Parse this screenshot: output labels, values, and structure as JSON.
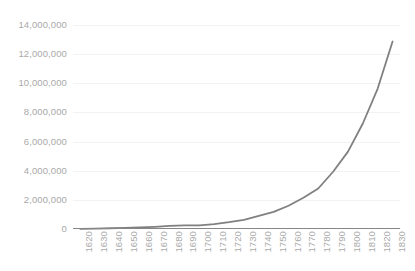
{
  "chart_data": {
    "type": "line",
    "title": "",
    "xlabel": "",
    "ylabel": "",
    "categories": [
      "1620",
      "1630",
      "1640",
      "1650",
      "1660",
      "1670",
      "1680",
      "1690",
      "1700",
      "1710",
      "1720",
      "1730",
      "1740",
      "1750",
      "1760",
      "1770",
      "1780",
      "1790",
      "1800",
      "1810",
      "1820",
      "1830"
    ],
    "values": [
      2300,
      26600,
      51000,
      75000,
      114000,
      152000,
      210000,
      250000,
      250900,
      331700,
      466200,
      629400,
      905600,
      1170800,
      1593600,
      2148100,
      2780400,
      3929214,
      5308483,
      7239881,
      9638453,
      12866020
    ],
    "series": [
      {
        "name": "Population",
        "values": [
          2300,
          26600,
          51000,
          75000,
          114000,
          152000,
          210000,
          250000,
          250900,
          331700,
          466200,
          629400,
          905600,
          1170800,
          1593600,
          2148100,
          2780400,
          3929214,
          5308483,
          7239881,
          9638453,
          12866020
        ],
        "color": "#808080"
      }
    ],
    "y_ticks": [
      0,
      2000000,
      4000000,
      6000000,
      8000000,
      10000000,
      12000000,
      14000000
    ],
    "y_tick_labels": [
      "0",
      "2,000,000",
      "4,000,000",
      "6,000,000",
      "8,000,000",
      "10,000,000",
      "12,000,000",
      "14,000,000"
    ],
    "ylim": [
      0,
      14000000
    ],
    "grid": true,
    "grid_color": "#f2f2f2",
    "legend": false,
    "legend_position": "none",
    "axis_line_color": "#868686",
    "label_color": "#a9a9a9",
    "background_color": "#ffffff",
    "line_color": "#808080",
    "line_width": 1.8
  }
}
